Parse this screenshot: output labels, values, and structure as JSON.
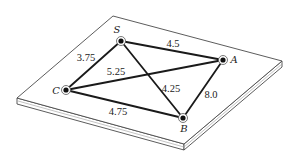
{
  "diagram": {
    "type": "weighted-undirected-graph-on-plate",
    "plate": {
      "top_face": [
        [
          113,
          16
        ],
        [
          282,
          61
        ],
        [
          184,
          144
        ],
        [
          17,
          98
        ]
      ],
      "thickness": 6
    },
    "nodes": [
      {
        "id": "S",
        "label": "S",
        "x": 121,
        "y": 41,
        "label_x": 117,
        "label_y": 33
      },
      {
        "id": "A",
        "label": "A",
        "x": 223,
        "y": 60,
        "label_x": 234,
        "label_y": 63
      },
      {
        "id": "C",
        "label": "C",
        "x": 66,
        "y": 90,
        "label_x": 56,
        "label_y": 94
      },
      {
        "id": "B",
        "label": "B",
        "x": 183,
        "y": 118,
        "label_x": 184,
        "label_y": 132
      }
    ],
    "edges": [
      {
        "from": "S",
        "to": "A",
        "weight": "4.5",
        "label_x": 173,
        "label_y": 47
      },
      {
        "from": "S",
        "to": "C",
        "weight": "3.75",
        "label_x": 86,
        "label_y": 61
      },
      {
        "from": "C",
        "to": "A",
        "weight": "5.25",
        "label_x": 116,
        "label_y": 75
      },
      {
        "from": "S",
        "to": "B",
        "weight": "4.25",
        "label_x": 171,
        "label_y": 92
      },
      {
        "from": "A",
        "to": "B",
        "weight": "8.0",
        "label_x": 211,
        "label_y": 98
      },
      {
        "from": "C",
        "to": "B",
        "weight": "4.75",
        "label_x": 118,
        "label_y": 115
      }
    ]
  },
  "labels": {
    "node_S": "S",
    "node_A": "A",
    "node_C": "C",
    "node_B": "B",
    "edge_SA": "4.5",
    "edge_SC": "3.75",
    "edge_CA": "5.25",
    "edge_SB": "4.25",
    "edge_AB": "8.0",
    "edge_CB": "4.75"
  }
}
